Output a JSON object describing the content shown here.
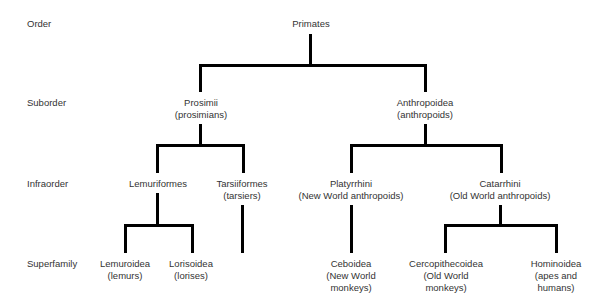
{
  "ranks": {
    "order": "Order",
    "suborder": "Suborder",
    "infraorder": "Infraorder",
    "superfamily": "Superfamily"
  },
  "nodes": {
    "primates": {
      "name": "Primates"
    },
    "prosimii": {
      "name": "Prosimii",
      "common": "(prosimians)"
    },
    "anthropoidea": {
      "name": "Anthropoidea",
      "common": "(anthropoids)"
    },
    "lemuriformes": {
      "name": "Lemuriformes"
    },
    "tarsiiformes": {
      "name": "Tarsiiformes",
      "common": "(tarsiers)"
    },
    "platyrrhini": {
      "name": "Platyrrhini",
      "common": "(New World anthropoids)"
    },
    "catarrhini": {
      "name": "Catarrhini",
      "common": "(Old World anthropoids)"
    },
    "lemuroidea": {
      "name": "Lemuroidea",
      "common": "(lemurs)"
    },
    "lorisoidea": {
      "name": "Lorisoidea",
      "common": "(lorises)"
    },
    "ceboidea": {
      "name": "Ceboidea",
      "common1": "(New World",
      "common2": "monkeys)"
    },
    "cercopithecoidea": {
      "name": "Cercopithecoidea",
      "common1": "(Old World",
      "common2": "monkeys)"
    },
    "hominoidea": {
      "name": "Hominoidea",
      "common1": "(apes and",
      "common2": "humans)"
    }
  }
}
